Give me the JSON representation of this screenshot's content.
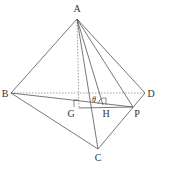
{
  "figure": {
    "type": "tetrahedron",
    "stroke_color": "#555555",
    "points": {
      "A": {
        "label": "A",
        "x": 77,
        "y": 19,
        "lx": 77,
        "ly": 12
      },
      "B": {
        "label": "B",
        "x": 11,
        "y": 93,
        "lx": 5,
        "ly": 97
      },
      "C": {
        "label": "C",
        "x": 98,
        "y": 149,
        "lx": 98,
        "ly": 161
      },
      "D": {
        "label": "D",
        "x": 145,
        "y": 93,
        "lx": 151,
        "ly": 97
      },
      "G": {
        "label": "G",
        "x": 79,
        "y": 108,
        "lx": 71,
        "ly": 117
      },
      "H": {
        "label": "H",
        "x": 103,
        "y": 105,
        "lx": 106,
        "ly": 117
      },
      "P": {
        "label": "P",
        "x": 133,
        "y": 107,
        "lx": 137,
        "ly": 117
      }
    },
    "angle_label": "θ",
    "solid_edges": [
      [
        "A",
        "B"
      ],
      [
        "A",
        "D"
      ],
      [
        "A",
        "C"
      ],
      [
        "A",
        "H"
      ],
      [
        "A",
        "P"
      ],
      [
        "B",
        "C"
      ],
      [
        "C",
        "D"
      ],
      [
        "B",
        "P"
      ],
      [
        "G",
        "P"
      ]
    ],
    "dashed_edges": [
      [
        "A",
        "G"
      ],
      [
        "B",
        "D"
      ]
    ]
  }
}
